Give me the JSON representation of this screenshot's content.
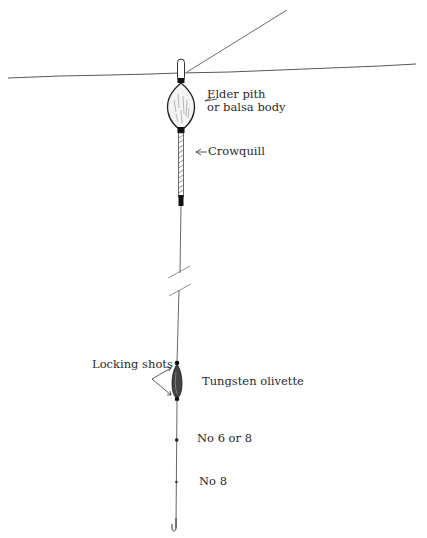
{
  "diagram": {
    "colors": {
      "ink": "#2a2a2a",
      "background": "#ffffff",
      "line": "#555555"
    },
    "labels": {
      "body": {
        "line1": "Elder pith",
        "line2": "or balsa body"
      },
      "crowquill": "Crowquill",
      "locking_shots": "Locking shots",
      "olivette": "Tungsten olivette",
      "shot_upper": "No 6 or 8",
      "shot_lower": "No 8"
    }
  }
}
